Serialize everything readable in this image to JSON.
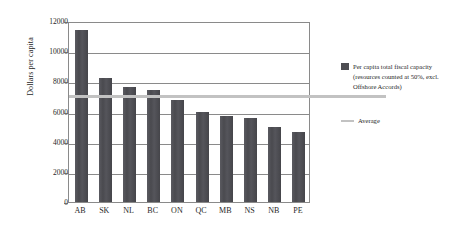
{
  "chart_data": {
    "type": "bar",
    "title": "",
    "xlabel": "",
    "ylabel": "Dollars per capita",
    "categories": [
      "AB",
      "SK",
      "NL",
      "BC",
      "ON",
      "QC",
      "MB",
      "NS",
      "NB",
      "PE"
    ],
    "series": [
      {
        "name": "Per capita total fiscal capacity (resources counted at 50%, excl. Offshore Accords)",
        "type": "bar",
        "color": "#4d4d52",
        "values": [
          11400,
          8200,
          7600,
          7450,
          6750,
          5950,
          5700,
          5550,
          5000,
          4650
        ]
      },
      {
        "name": "Average",
        "type": "line",
        "color": "#c2c2c2",
        "value": 7100
      }
    ],
    "ylim": [
      0,
      12000
    ],
    "yticks": [
      0,
      2000,
      4000,
      6000,
      8000,
      10000,
      12000
    ],
    "ytick_labels": [
      "0",
      "2000",
      "4000",
      "6000",
      "8000",
      "10000",
      "12000"
    ],
    "grid": true,
    "grid_axis": "y",
    "legend_position": "right"
  },
  "legend": {
    "bar_label": "Per capita total fiscal capacity (resources counted at 50%, excl. Offshore Accords)",
    "average_label": "Average"
  }
}
